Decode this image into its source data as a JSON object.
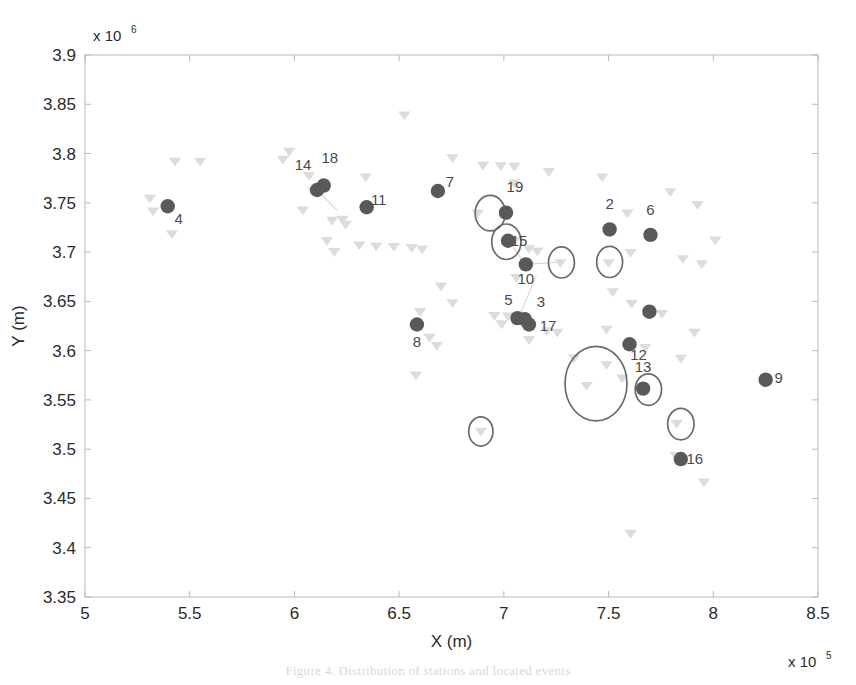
{
  "figure": {
    "caption": "Figure 4. Distribution of stations and located events"
  },
  "chart_data": {
    "type": "scatter",
    "title": "",
    "xlabel": "X (m)",
    "ylabel": "Y (m)",
    "x_exponent_label": "x 10",
    "x_exponent_power": "5",
    "y_exponent_label": "x 10",
    "y_exponent_power": "6",
    "xlim": [
      5,
      8.5
    ],
    "ylim": [
      3.35,
      3.9
    ],
    "xticks": [
      "5",
      "5.5",
      "6",
      "6.5",
      "7",
      "7.5",
      "8",
      "8.5"
    ],
    "yticks": [
      "3.35",
      "3.4",
      "3.45",
      "3.5",
      "3.55",
      "3.6",
      "3.65",
      "3.7",
      "3.75",
      "3.8",
      "3.85",
      "3.9"
    ],
    "grid": false,
    "legend": null,
    "colors": {
      "station_marker": "#595959",
      "event_marker": "#dcdcdc",
      "ellipse_stroke": "#6b6b6b",
      "axis": "#b9b9b9",
      "label_text": "#4a4a4a",
      "connector": "#d5d5d5",
      "background": "#ffffff"
    },
    "series": [
      {
        "name": "stations",
        "marker": "filled-circle",
        "color": "#595959",
        "points": [
          {
            "label": "4",
            "x": 5.395,
            "y": 3.7465,
            "lx": 11,
            "ly": 18
          },
          {
            "label": "14",
            "x": 6.108,
            "y": 3.763,
            "lx": -14,
            "ly": -20
          },
          {
            "label": "18",
            "x": 6.14,
            "y": 3.7675,
            "lx": 6,
            "ly": -23
          },
          {
            "label": "11",
            "x": 6.345,
            "y": 3.7455,
            "lx": 12,
            "ly": -2
          },
          {
            "label": "7",
            "x": 6.685,
            "y": 3.762,
            "lx": 12,
            "ly": -4
          },
          {
            "label": "19",
            "x": 7.01,
            "y": 3.74,
            "lx": 9,
            "ly": -21
          },
          {
            "label": "15",
            "x": 7.02,
            "y": 3.7115,
            "lx": 11,
            "ly": 5
          },
          {
            "label": "10",
            "x": 7.105,
            "y": 3.6875,
            "lx": 0,
            "ly": 20
          },
          {
            "label": "2",
            "x": 7.505,
            "y": 3.723,
            "lx": 0,
            "ly": -20
          },
          {
            "label": "6",
            "x": 7.7,
            "y": 3.7175,
            "lx": 0,
            "ly": -20
          },
          {
            "label": "5",
            "x": 7.065,
            "y": 3.633,
            "lx": -9,
            "ly": -13
          },
          {
            "label": "3",
            "x": 7.1,
            "y": 3.632,
            "lx": 16,
            "ly": -12
          },
          {
            "label": "17",
            "x": 7.12,
            "y": 3.6265,
            "lx": 19,
            "ly": 6
          },
          {
            "label": "8",
            "x": 6.585,
            "y": 3.6265,
            "lx": 0,
            "ly": 22
          },
          {
            "label": "12",
            "x": 7.6,
            "y": 3.6065,
            "lx": 9,
            "ly": 16
          },
          {
            "label": "13",
            "x": 7.665,
            "y": 3.5615,
            "lx": 0,
            "ly": -17
          },
          {
            "label": "16",
            "x": 7.845,
            "y": 3.49,
            "lx": 14,
            "ly": 5
          },
          {
            "label": "9",
            "x": 8.25,
            "y": 3.5705,
            "lx": 13,
            "ly": 3
          },
          {
            "label": "",
            "x": 7.695,
            "y": 3.6395,
            "lx": 0,
            "ly": 0
          }
        ]
      },
      {
        "name": "events",
        "marker": "down-triangle",
        "color": "#dcdcdc",
        "points": [
          [
            6.525,
            3.839
          ],
          [
            5.975,
            3.802
          ],
          [
            6.755,
            3.7955
          ],
          [
            5.945,
            3.794
          ],
          [
            5.43,
            3.792
          ],
          [
            5.55,
            3.792
          ],
          [
            6.9,
            3.788
          ],
          [
            6.985,
            3.7875
          ],
          [
            7.05,
            3.787
          ],
          [
            7.215,
            3.7815
          ],
          [
            6.07,
            3.7775
          ],
          [
            6.34,
            3.776
          ],
          [
            7.47,
            3.776
          ],
          [
            7.05,
            3.77
          ],
          [
            6.09,
            3.762
          ],
          [
            7.795,
            3.761
          ],
          [
            5.31,
            3.7545
          ],
          [
            7.925,
            3.748
          ],
          [
            5.325,
            3.7415
          ],
          [
            6.04,
            3.7425
          ],
          [
            6.23,
            3.733
          ],
          [
            6.18,
            3.732
          ],
          [
            6.245,
            3.728
          ],
          [
            7.59,
            3.7395
          ],
          [
            6.875,
            3.7395
          ],
          [
            7.05,
            3.7115
          ],
          [
            7.27,
            3.689
          ],
          [
            7.5,
            3.689
          ],
          [
            7.16,
            3.701
          ],
          [
            8.01,
            3.712
          ],
          [
            7.605,
            3.6995
          ],
          [
            7.855,
            3.693
          ],
          [
            5.415,
            3.7185
          ],
          [
            6.155,
            3.7115
          ],
          [
            6.31,
            3.707
          ],
          [
            6.39,
            3.706
          ],
          [
            6.475,
            3.7055
          ],
          [
            6.56,
            3.7045
          ],
          [
            6.61,
            3.703
          ],
          [
            7.12,
            3.7035
          ],
          [
            6.19,
            3.7005
          ],
          [
            7.945,
            3.688
          ],
          [
            7.06,
            3.674
          ],
          [
            6.7,
            3.6655
          ],
          [
            7.52,
            3.6595
          ],
          [
            6.755,
            3.6485
          ],
          [
            7.61,
            3.648
          ],
          [
            6.6,
            3.6395
          ],
          [
            6.955,
            3.6355
          ],
          [
            7.02,
            3.635
          ],
          [
            7.755,
            3.6375
          ],
          [
            6.99,
            3.627
          ],
          [
            7.205,
            3.62
          ],
          [
            7.255,
            3.6185
          ],
          [
            7.49,
            3.6215
          ],
          [
            7.91,
            3.6185
          ],
          [
            6.645,
            3.6135
          ],
          [
            7.12,
            3.611
          ],
          [
            6.68,
            3.605
          ],
          [
            7.675,
            3.603
          ],
          [
            7.335,
            3.5925
          ],
          [
            7.845,
            3.592
          ],
          [
            7.49,
            3.5855
          ],
          [
            7.565,
            3.572
          ],
          [
            6.58,
            3.575
          ],
          [
            7.395,
            3.5645
          ],
          [
            7.665,
            3.5615
          ],
          [
            7.825,
            3.526
          ],
          [
            6.89,
            3.518
          ],
          [
            7.82,
            3.4935
          ],
          [
            7.955,
            3.4665
          ],
          [
            7.605,
            3.4145
          ]
        ]
      }
    ],
    "ellipses": [
      {
        "cx": 6.935,
        "cy": 3.7395,
        "rx": 0.072,
        "ry": 0.018
      },
      {
        "cx": 7.012,
        "cy": 3.7105,
        "rx": 0.07,
        "ry": 0.018
      },
      {
        "cx": 7.275,
        "cy": 3.6895,
        "rx": 0.062,
        "ry": 0.0158
      },
      {
        "cx": 7.505,
        "cy": 3.69,
        "rx": 0.062,
        "ry": 0.0158
      },
      {
        "cx": 7.44,
        "cy": 3.5665,
        "rx": 0.148,
        "ry": 0.0378
      },
      {
        "cx": 7.69,
        "cy": 3.5605,
        "rx": 0.063,
        "ry": 0.016
      },
      {
        "cx": 7.845,
        "cy": 3.5255,
        "rx": 0.063,
        "ry": 0.016
      },
      {
        "cx": 6.89,
        "cy": 3.518,
        "rx": 0.058,
        "ry": 0.0148
      }
    ],
    "connectors": [
      [
        [
          6.108,
          3.763
        ],
        [
          6.205,
          3.742
        ]
      ],
      [
        [
          7.02,
          3.7115
        ],
        [
          7.105,
          3.6875
        ]
      ],
      [
        [
          7.105,
          3.6875
        ],
        [
          7.28,
          3.69
        ]
      ],
      [
        [
          7.07,
          3.633
        ],
        [
          7.155,
          3.676
        ]
      ]
    ]
  }
}
